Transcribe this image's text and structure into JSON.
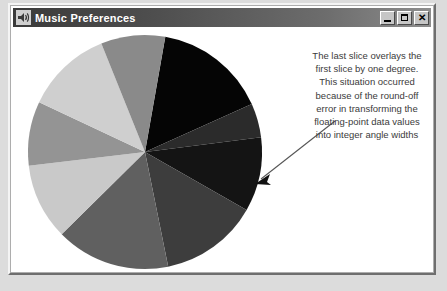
{
  "window": {
    "title": "Music Preferences",
    "icon": "speaker-icon",
    "controls": [
      {
        "name": "minimize-button",
        "glyph": "_"
      },
      {
        "name": "maximize-button",
        "glyph": "□"
      },
      {
        "name": "close-button",
        "glyph": "✕"
      }
    ]
  },
  "annotation": {
    "lines": [
      "The last slice overlays the",
      "first slice by one degree.",
      "This situation occurred",
      "because of the round-off",
      "error in transforming the",
      "floating-point data values",
      "into integer angle widths"
    ],
    "arrow": "annotation-arrow"
  },
  "chart_data": {
    "type": "pie",
    "title": "Music Preferences",
    "xlabel": "",
    "ylabel": "",
    "legend": "none",
    "grid": false,
    "start_angle_deg": -80,
    "direction": "clockwise",
    "note": "The last slice overlays the first slice by one degree due to round-off error converting floating-point values to integer angle widths.",
    "categories": [
      "Slice 1",
      "Slice 2",
      "Slice 3",
      "Slice 4",
      "Slice 5",
      "Slice 6",
      "Slice 7",
      "Slice 8",
      "Slice 9"
    ],
    "values": [
      56,
      17,
      37,
      49,
      57,
      38,
      32,
      43,
      32
    ],
    "colors": [
      "#050505",
      "#2b2b2b",
      "#141414",
      "#3d3d3d",
      "#606060",
      "#c9c9c9",
      "#949494",
      "#cfcfcf",
      "#8a8a8a"
    ]
  },
  "theme": {
    "page_background": "#dcdcdc",
    "window_background": "#ffffff",
    "titlebar_start": "#3a3a3a",
    "titlebar_end": "#8d8d8d",
    "title_color": "#ffffff",
    "annotation_color": "#3b3b3b"
  }
}
